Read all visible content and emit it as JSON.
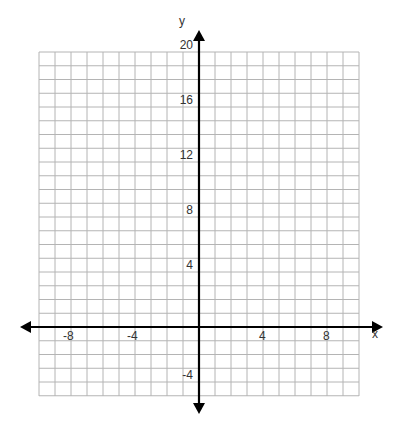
{
  "chart_data": {
    "type": "scatter",
    "title": "",
    "xlabel": "x",
    "ylabel": "y",
    "xlim": [
      -10,
      10
    ],
    "ylim": [
      -5,
      20
    ],
    "grid": true,
    "grid_step_x": 1,
    "grid_step_y": 1,
    "x_ticks": [
      -8,
      -4,
      4,
      8
    ],
    "x_tick_labels": [
      "-8",
      "-4",
      "4",
      "8"
    ],
    "y_ticks": [
      -4,
      4,
      8,
      12,
      16,
      20
    ],
    "y_tick_labels": [
      "-4",
      "4",
      "8",
      "12",
      "16",
      "20"
    ],
    "series": [],
    "legend": null,
    "colors": {
      "grid": "#b4b4b4",
      "axis": "#000000",
      "text": "#333333",
      "background": "#ffffff"
    }
  }
}
